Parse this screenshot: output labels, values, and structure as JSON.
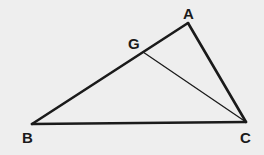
{
  "diagram": {
    "type": "geometry-triangle",
    "background": "#eeeeee",
    "stroke_color": "#1a1a1a",
    "points": {
      "A": {
        "label": "A",
        "x": 188,
        "y": 23
      },
      "B": {
        "label": "B",
        "x": 32,
        "y": 124
      },
      "C": {
        "label": "C",
        "x": 246,
        "y": 122
      },
      "G": {
        "label": "G",
        "x": 143,
        "y": 52
      }
    },
    "segments": [
      {
        "from": "A",
        "to": "B",
        "weight": "thick"
      },
      {
        "from": "B",
        "to": "C",
        "weight": "thick"
      },
      {
        "from": "C",
        "to": "A",
        "weight": "thick"
      },
      {
        "from": "G",
        "to": "C",
        "weight": "thin"
      }
    ],
    "labels": {
      "A": "A",
      "B": "B",
      "C": "C",
      "G": "G"
    }
  }
}
